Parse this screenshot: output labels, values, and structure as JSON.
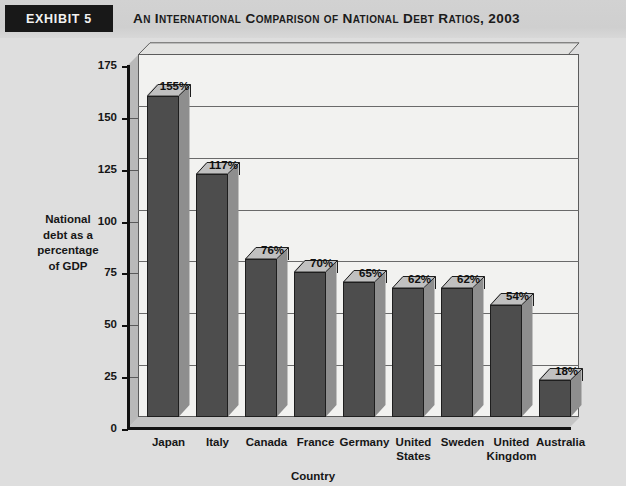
{
  "header": {
    "exhibit_tag": "Exhibit 5",
    "title": "An International Comparison of National Debt Ratios, 2003"
  },
  "chart_data": {
    "type": "bar",
    "title": "An International Comparison of National Debt Ratios, 2003",
    "categories": [
      "Japan",
      "Italy",
      "Canada",
      "France",
      "Germany",
      "United States",
      "Sweden",
      "United Kingdom",
      "Australia"
    ],
    "values": [
      155,
      117,
      76,
      70,
      65,
      62,
      62,
      54,
      18
    ],
    "data_labels": [
      "155%",
      "117%",
      "76%",
      "70%",
      "65%",
      "62%",
      "62%",
      "54%",
      "18%"
    ],
    "xlabel": "Country",
    "ylabel": "National debt as a percentage of GDP",
    "ylabel_lines": [
      "National",
      "debt as a",
      "percentage",
      "of  GDP"
    ],
    "ylim": [
      0,
      175
    ],
    "ytick_labels": [
      "0",
      "25",
      "50",
      "75",
      "100",
      "125",
      "150",
      "175"
    ],
    "ytick_values": [
      0,
      25,
      50,
      75,
      100,
      125,
      150,
      175
    ],
    "grid": true,
    "legend": "none",
    "style": "3d-bar",
    "colors": {
      "bar_front": "#4d4d4d",
      "bar_side": "#8e8e8e",
      "bar_top": "#c0c0c0",
      "plot_background": "#f2f2f0",
      "page_background": "#dedede",
      "axis": "#111111",
      "gridline": "#6a6a6a"
    }
  }
}
